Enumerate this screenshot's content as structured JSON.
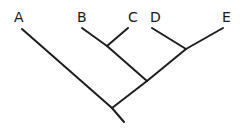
{
  "figure": {
    "type": "cladogram",
    "title": "",
    "width": 242,
    "height": 131,
    "background_color": "#ffffff",
    "line_color": "#1d1d1d",
    "line_width": 2,
    "label_color": "#1a1a1a",
    "label_font_size": 14
  },
  "taxa": [
    {
      "id": "A",
      "label": "A",
      "label_x": 14,
      "label_y": 10,
      "tip_x": 22,
      "tip_y": 29
    },
    {
      "id": "B",
      "label": "B",
      "label_x": 77,
      "label_y": 10,
      "tip_x": 82,
      "tip_y": 28
    },
    {
      "id": "C",
      "label": "C",
      "label_x": 128,
      "label_y": 10,
      "tip_x": 128,
      "tip_y": 28
    },
    {
      "id": "D",
      "label": "D",
      "label_x": 150,
      "label_y": 10,
      "tip_x": 152,
      "tip_y": 28
    },
    {
      "id": "E",
      "label": "E",
      "label_x": 222,
      "label_y": 10,
      "tip_x": 223,
      "tip_y": 28
    }
  ],
  "nodes": [
    {
      "id": "node-bc",
      "label": "B+C clade node",
      "x": 107,
      "y": 46
    },
    {
      "id": "node-de",
      "label": "D+E clade node",
      "x": 186,
      "y": 49
    },
    {
      "id": "node-bcde",
      "label": "B+C+D+E clade node",
      "x": 147,
      "y": 81
    },
    {
      "id": "node-root",
      "label": "root node",
      "x": 112,
      "y": 108
    },
    {
      "id": "root-tail",
      "label": "root branch end",
      "x": 124,
      "y": 122
    }
  ],
  "branches": [
    {
      "id": "branch-a",
      "from": "A",
      "to": "node-root",
      "x1": 22,
      "y1": 29,
      "x2": 112,
      "y2": 108
    },
    {
      "id": "branch-b",
      "from": "B",
      "to": "node-bc",
      "x1": 82,
      "y1": 28,
      "x2": 107,
      "y2": 46
    },
    {
      "id": "branch-c",
      "from": "C",
      "to": "node-bc",
      "x1": 128,
      "y1": 28,
      "x2": 107,
      "y2": 46
    },
    {
      "id": "branch-bc",
      "from": "node-bc",
      "to": "node-bcde",
      "x1": 107,
      "y1": 46,
      "x2": 147,
      "y2": 81
    },
    {
      "id": "branch-d",
      "from": "D",
      "to": "node-de",
      "x1": 152,
      "y1": 28,
      "x2": 186,
      "y2": 49
    },
    {
      "id": "branch-e",
      "from": "E",
      "to": "node-de",
      "x1": 223,
      "y1": 28,
      "x2": 186,
      "y2": 49
    },
    {
      "id": "branch-de",
      "from": "node-de",
      "to": "node-bcde",
      "x1": 186,
      "y1": 49,
      "x2": 147,
      "y2": 81
    },
    {
      "id": "branch-bcde",
      "from": "node-bcde",
      "to": "node-root",
      "x1": 147,
      "y1": 81,
      "x2": 112,
      "y2": 108
    },
    {
      "id": "branch-root",
      "from": "node-root",
      "to": "root-tail",
      "x1": 112,
      "y1": 108,
      "x2": 124,
      "y2": 122
    }
  ]
}
